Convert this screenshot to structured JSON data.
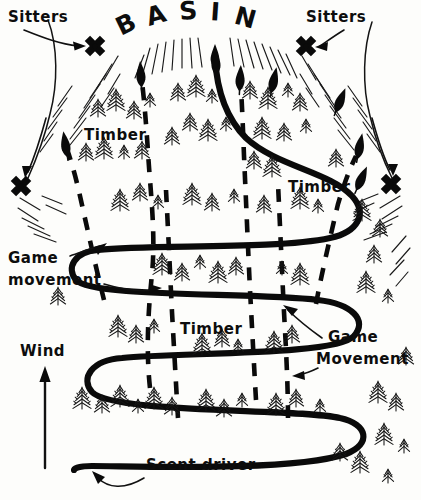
{
  "diagram": {
    "title_letters": [
      "B",
      "A",
      "S",
      "I",
      "N"
    ],
    "style": "hand-drawn pen-and-ink hunting tactics map",
    "background_color": "#fdfdfb",
    "ink_color": "#0d0d0d"
  },
  "labels": {
    "sitters_left": "Sitters",
    "sitters_right": "Sitters",
    "timber_upper_left": "Timber",
    "timber_mid_right": "Timber",
    "timber_lower_center": "Timber",
    "game_movement_left_line1": "Game",
    "game_movement_left_line2": "movement",
    "game_movement_right_line1": "Game",
    "game_movement_right_line2": "Movement",
    "wind": "Wind",
    "scent_driver": "Scent driver"
  },
  "markers": {
    "sitter_x_count": 4,
    "sitter_positions": [
      "top-left",
      "top-right",
      "mid-left",
      "mid-right"
    ],
    "x_glyph": "x-mark"
  },
  "legend_semantics": {
    "thick_solid_line": "Scent driver route (switchback drive path)",
    "dashed_line_with_arrowhead": "Game movement / escape routes",
    "x_mark": "Sitter stand position",
    "vertical_up_arrow": "Wind direction",
    "conifer": "Timber stand"
  }
}
